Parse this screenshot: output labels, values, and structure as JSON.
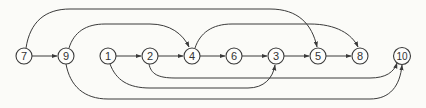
{
  "diagram": {
    "type": "directed-graph",
    "colors": {
      "background": "#fbfbf8",
      "stroke": "#3a3a3a",
      "text": "#333333"
    },
    "nodes": [
      {
        "id": "7",
        "label": "7",
        "x": 24,
        "y": 56
      },
      {
        "id": "9",
        "label": "9",
        "x": 66,
        "y": 56
      },
      {
        "id": "1",
        "label": "1",
        "x": 108,
        "y": 56
      },
      {
        "id": "2",
        "label": "2",
        "x": 150,
        "y": 56
      },
      {
        "id": "4",
        "label": "4",
        "x": 192,
        "y": 56
      },
      {
        "id": "6",
        "label": "6",
        "x": 234,
        "y": 56
      },
      {
        "id": "3",
        "label": "3",
        "x": 276,
        "y": 56
      },
      {
        "id": "5",
        "label": "5",
        "x": 318,
        "y": 56
      },
      {
        "id": "8",
        "label": "8",
        "x": 360,
        "y": 56
      },
      {
        "id": "10",
        "label": "10",
        "x": 402,
        "y": 56
      }
    ],
    "edges": [
      {
        "from": "7",
        "to": "9"
      },
      {
        "from": "7",
        "to": "5"
      },
      {
        "from": "9",
        "to": "4"
      },
      {
        "from": "9",
        "to": "10"
      },
      {
        "from": "1",
        "to": "2"
      },
      {
        "from": "1",
        "to": "3"
      },
      {
        "from": "2",
        "to": "4"
      },
      {
        "from": "2",
        "to": "10"
      },
      {
        "from": "4",
        "to": "6"
      },
      {
        "from": "4",
        "to": "8"
      },
      {
        "from": "6",
        "to": "3"
      },
      {
        "from": "3",
        "to": "5"
      },
      {
        "from": "5",
        "to": "8"
      }
    ]
  }
}
